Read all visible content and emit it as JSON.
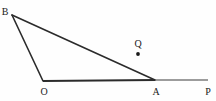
{
  "figure": {
    "type": "geometry-diagram",
    "canvas": {
      "width": 216,
      "height": 101,
      "background": "#fefefe"
    },
    "stroke_color": "#2b2b2b",
    "label_color": "#1a1a1a",
    "points": [
      {
        "name": "B",
        "label": "B",
        "x": 12,
        "y": 15,
        "label_x": 5,
        "label_y": 12,
        "marked": false
      },
      {
        "name": "O",
        "label": "O",
        "x": 43,
        "y": 81,
        "label_x": 44,
        "label_y": 92,
        "marked": false
      },
      {
        "name": "A",
        "label": "A",
        "x": 155,
        "y": 80,
        "label_x": 156,
        "label_y": 92,
        "marked": false
      },
      {
        "name": "P",
        "label": "P",
        "x": 208,
        "y": 80,
        "label_x": 208,
        "label_y": 92,
        "marked": false
      },
      {
        "name": "Q",
        "label": "Q",
        "x": 138,
        "y": 54,
        "label_x": 138,
        "label_y": 44,
        "marked": true
      }
    ],
    "segments": [
      {
        "name": "segment-B-O",
        "from": "B",
        "to": "O",
        "x1": 12,
        "y1": 15,
        "x2": 43,
        "y2": 81,
        "width": 1.6
      },
      {
        "name": "segment-B-A",
        "from": "B",
        "to": "A",
        "x1": 12,
        "y1": 15,
        "x2": 155,
        "y2": 80,
        "width": 1.6
      },
      {
        "name": "segment-O-A",
        "from": "O",
        "to": "A",
        "x1": 43,
        "y1": 81,
        "x2": 155,
        "y2": 80,
        "width": 2.0
      },
      {
        "name": "segment-A-P",
        "from": "A",
        "to": "P",
        "x1": 155,
        "y1": 80,
        "x2": 208,
        "y2": 80,
        "width": 1.2
      }
    ],
    "point_marker": {
      "name": "Q",
      "cx": 138,
      "cy": 54,
      "r": 1.9
    },
    "watermark": {
      "text": "",
      "x": 174,
      "y": 56
    }
  }
}
